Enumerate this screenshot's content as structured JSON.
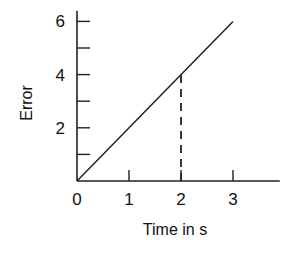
{
  "chart_data": {
    "type": "line",
    "title": "",
    "xlabel": "Time in s",
    "ylabel": "Error",
    "xlim": [
      0,
      3.9
    ],
    "ylim": [
      0,
      6.4
    ],
    "x_ticks": [
      0,
      1,
      2,
      3
    ],
    "x_tick_labels": [
      "0",
      "1",
      "2",
      "3"
    ],
    "y_ticks_major": [
      2,
      4,
      6
    ],
    "y_tick_labels": [
      "2",
      "4",
      "6"
    ],
    "y_ticks_minor": [
      1,
      3,
      5
    ],
    "grid": false,
    "legend": "none",
    "series": [
      {
        "name": "Error",
        "x": [
          0,
          3
        ],
        "y": [
          0,
          6
        ]
      }
    ],
    "annotations": [
      {
        "type": "dashed-vertical",
        "x": 2,
        "y_from": 0,
        "y_to": 4
      }
    ],
    "origin_label": "0"
  }
}
